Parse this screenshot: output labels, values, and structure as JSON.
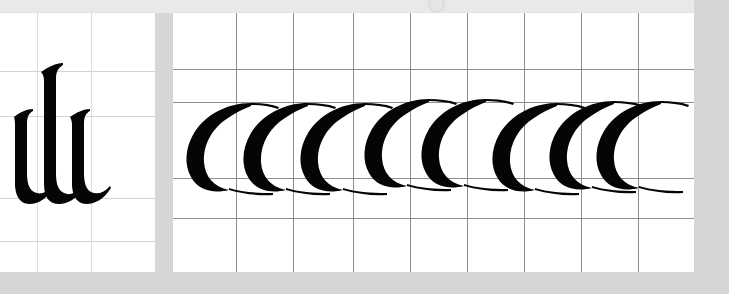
{
  "document": {
    "title": "Calligraphy exemplar sheet",
    "description": "Scanned blackletter / gothic calligraphy practice plate on ruled guide paper",
    "background_color": "#d6d6d6",
    "paper_color": "#ffffff",
    "ink_color": "#000000"
  },
  "top_chrome": {
    "visible": true,
    "background_color": "#e9e9e9",
    "dot_icon": "circle-icon"
  },
  "plates": [
    {
      "id": "left",
      "name": "minim-plate",
      "label": "ili",
      "glyph_sequence": [
        "i",
        "l",
        "i"
      ],
      "grid": {
        "line_color": "#dcdcdc",
        "vertical_positions": [
          43,
          97
        ],
        "horizontal_positions": [
          58,
          103,
          185,
          228
        ]
      },
      "bounds": {
        "x": -6,
        "y": 13,
        "width": 161,
        "height": 259
      }
    },
    {
      "id": "right",
      "name": "c-stroke-plate",
      "label": "ccccccccc",
      "glyph_sequence": [
        "c",
        "c",
        "c",
        "c",
        "c",
        "c",
        "c",
        "c"
      ],
      "glyph_count": 8,
      "grid": {
        "line_color": "#8e8e8e",
        "vertical_positions": [
          63,
          120,
          180,
          237,
          294,
          351,
          408,
          465
        ],
        "horizontal_positions": [
          56,
          89,
          165,
          205
        ]
      },
      "bounds": {
        "x": 173,
        "y": 13,
        "width": 521,
        "height": 259
      }
    }
  ],
  "guide_lines": {
    "ascender_label": "ascender line",
    "waist_label": "waist line",
    "baseline_label": "baseline",
    "descender_label": "descender line"
  }
}
